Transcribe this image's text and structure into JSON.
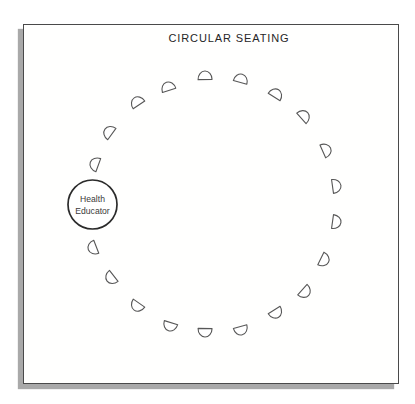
{
  "page": {
    "title": "CIRCULAR SEATING"
  },
  "facilitator": {
    "label_line1": "Health",
    "label_line2": "Educator",
    "x": 92.5,
    "y": 204.5,
    "radius": 24.5
  },
  "diagram": {
    "center_x": 207,
    "center_y": 204,
    "radius": 128,
    "chair_count": 20,
    "chairs": [
      {
        "x": 205,
        "y": 76,
        "rot": -1
      },
      {
        "x": 241,
        "y": 79,
        "rot": 15
      },
      {
        "x": 276,
        "y": 94,
        "rot": 32
      },
      {
        "x": 304,
        "y": 116,
        "rot": 48
      },
      {
        "x": 326,
        "y": 150,
        "rot": 66
      },
      {
        "x": 336,
        "y": 186,
        "rot": 82
      },
      {
        "x": 336,
        "y": 222,
        "rot": 98
      },
      {
        "x": 324,
        "y": 260,
        "rot": 116
      },
      {
        "x": 305,
        "y": 292,
        "rot": 132
      },
      {
        "x": 276,
        "y": 313,
        "rot": 148
      },
      {
        "x": 241,
        "y": 330,
        "rot": 165
      },
      {
        "x": 205,
        "y": 332,
        "rot": 181
      },
      {
        "x": 170,
        "y": 326,
        "rot": 197
      },
      {
        "x": 137,
        "y": 306,
        "rot": 215
      },
      {
        "x": 111,
        "y": 278,
        "rot": 232
      },
      {
        "x": 93,
        "y": 248,
        "rot": 249
      },
      {
        "x": 95,
        "y": 164,
        "rot": 290
      },
      {
        "x": 109,
        "y": 132,
        "rot": 306
      },
      {
        "x": 137,
        "y": 102,
        "rot": 326
      },
      {
        "x": 168,
        "y": 87,
        "rot": 342
      }
    ]
  },
  "colors": {
    "card_border": "#4a4a4a",
    "card_shadow": "#a9a9a9",
    "chair_stroke": "#575757",
    "line_dark": "#2b2b2b",
    "text_dark": "#3a3a3a",
    "title_text": "#262626"
  }
}
